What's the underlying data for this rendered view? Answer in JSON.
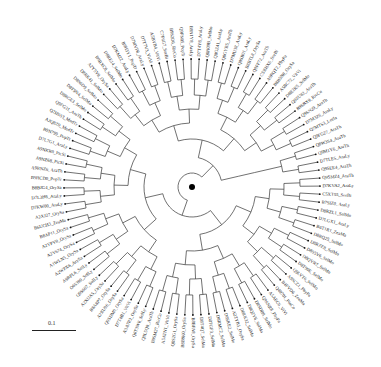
{
  "figure": {
    "type": "circular phylogenetic tree",
    "root": {
      "x": 192,
      "y": 187
    },
    "scale_bar": {
      "label": "0.1",
      "length_px": 44
    },
    "leaves": [
      "Q9SMZ4_AraTh",
      "D7KVA2_AraLy",
      "C5XT55_SorBi",
      "B7SIZ0_AraLy",
      "D8RZL1_SelMo",
      "D7LGX1_AraLy",
      "B6T1R1_ZeaMa",
      "D8RQ25_SelMo",
      "D8RZE8_SelMo",
      "D8S5V6_SelMo",
      "D8QVR7_SelMo",
      "D8T90E_SelMo",
      "Q9LVT6_SelMo",
      "A9SCZ1_PhyPa",
      "B4FVD6_ZeaMa",
      "Q40701_PinCo",
      "A5AEC6_ViVi",
      "Q9SNR8_PhyPa",
      "D8SDB9_SelMo",
      "D8Q2Y6_SelMo",
      "D8RK32_SelMo",
      "A2ZYB5_OrySa",
      "D8SKE2_SelMo",
      "D8RMC2_SelMo",
      "D8TGF3_SelMo",
      "D8T4Q7_SelMo",
      "B8BPA8_OrySa",
      "B8B9K0_OrySa",
      "Q8S2G1_OrySa",
      "A5ATN1_VitVi",
      "B9SM27_RicCo",
      "Q8L5Q0_AraTh",
      "Q6T3W6_SolLy",
      "A3A7R2_OrySa",
      "D7T4B1_VitVi",
      "Q9SDM0_OrySa",
      "A2XU96_OrySa",
      "B8A8P7_OrySa",
      "A2XUA5_OrySa",
      "Q9S667_SolLy",
      "O65399_SolLy",
      "A9RPL6_SolLy",
      "A2WPX6_ArySa",
      "A1WLN5_OrySa",
      "A2Y674_OrySa",
      "A2YPV0_OrySa",
      "B8AP11_OrySa",
      "B6UCH3_ZeaMa",
      "A2XJ27_OrySa",
      "D7KW00_AraLy",
      "D7L3H6_AraLy",
      "B8BJG4_OrySa",
      "B9HCD0_PopTr",
      "A9RNZ6_AraTh",
      "A9NZ68_PicSi",
      "A9NKR0_PicSi",
      "D7L7G1_AraLy",
      "B9N799_PopTr",
      "A2Q8Z0_MedTr",
      "Q2HSS3_MedTr",
      "Q9FG31_AraTh",
      "D8RGE3_SelMo",
      "D8T9N4_SelMo",
      "D8S6D9_SelMo",
      "D8RK41_SelMo",
      "A2Y5Y8_OrySa",
      "B9RXC8_SelMo",
      "D8RE14_SelMo",
      "D7KM22_AraLy",
      "B9H3Y1_PopTr",
      "D7MVP8_AraLy",
      "D7T7V3_VitVi",
      "A5BVB4_VitVi",
      "C7F6G7_SorBi",
      "B9S2D6_RicCo",
      "Q9FN05_PopTr",
      "B9N1Y8_AraLy",
      "D7T4Y8_AraLy",
      "Q8H09B_SelMo",
      "Q8GZ41_AraLy",
      "Q8GYB5_AraTh",
      "D7MU38_AraLy",
      "Q9SB01_AraLy",
      "B8BTL8_OrySa",
      "Q9FF72_AraTh",
      "C5XHX6_SorBi",
      "A9RQT2_PhyPa",
      "B8B5N0_OrySa",
      "A5BC72_VitVi",
      "D8R2K5_SelMo",
      "Q9ZU82_AraTh",
      "B9SBX9_RicCo",
      "Q9SN29_AraTh",
      "D7M3Z6_AraLy",
      "Q7MTS3_LotJa",
      "Q9FG27_AraTh",
      "Q8W3S4_AraTh",
      "Q9M1Y6_AraTh",
      "D7TLE5_AraLy",
      "Q9SEE4_AraTh"
    ]
  }
}
